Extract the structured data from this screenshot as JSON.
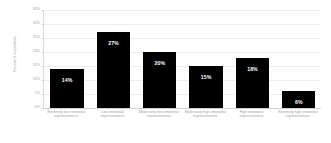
{
  "chart_data": {
    "type": "bar",
    "title": "",
    "subtitle": "",
    "xlabel": "",
    "ylabel": "Percent of respondents",
    "ylim": [
      0,
      35
    ],
    "grid": true,
    "legend": false,
    "legend_position": "none",
    "bar_color": "#000000",
    "label_color": "#ffffff",
    "axis_text_color": "#9d9d9d",
    "gridline_color": "#ededed",
    "background": "#ffffff",
    "categories": [
      "Extremely low emotional expressiveness",
      "Low emotional expressiveness",
      "Moderately low emotional expressiveness",
      "Moderately high emotional expressiveness",
      "High emotional expressiveness",
      "Extremely high emotional expressiveness"
    ],
    "values": [
      14,
      27,
      20,
      15,
      18,
      6
    ],
    "value_labels": [
      "14%",
      "27%",
      "20%",
      "15%",
      "18%",
      "6%"
    ],
    "yticks": [
      0,
      5,
      10,
      15,
      20,
      25,
      30,
      35
    ],
    "ytick_labels": [
      "0%",
      "5%",
      "10%",
      "15%",
      "20%",
      "25%",
      "30%",
      "35%"
    ]
  }
}
